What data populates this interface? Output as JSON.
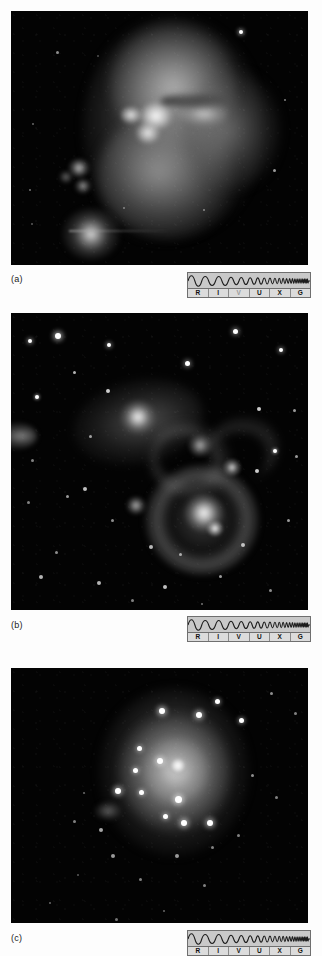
{
  "figure": {
    "background_color": "#fdfdfd",
    "image_background_color": "#000000",
    "panel_count": 3
  },
  "spectrum_band": {
    "name": "electromagnetic-spectrum-indicator",
    "description": "Wave increasing in frequency from left to right across the electromagnetic spectrum",
    "band_background": "#c9c9c9",
    "label_row_background": "#dcdcdc",
    "border_color": "#6f6f6f",
    "labels": [
      {
        "code": "R",
        "meaning": "Radio"
      },
      {
        "code": "I",
        "meaning": "Infrared"
      },
      {
        "code": "V",
        "meaning": "Visible"
      },
      {
        "code": "U",
        "meaning": "Ultraviolet"
      },
      {
        "code": "X",
        "meaning": "X-ray"
      },
      {
        "code": "G",
        "meaning": "Gamma ray"
      }
    ]
  },
  "panels": [
    {
      "id": "a",
      "caption": "(a)",
      "subject": "irregular-galaxy-with-bright-knots",
      "active_band": "V",
      "band_labels": [
        {
          "code": "R",
          "active": true
        },
        {
          "code": "I",
          "active": true
        },
        {
          "code": "V",
          "active": false
        },
        {
          "code": "U",
          "active": true
        },
        {
          "code": "X",
          "active": true
        },
        {
          "code": "G",
          "active": true
        }
      ]
    },
    {
      "id": "b",
      "caption": "(b)",
      "subject": "interacting-galaxy-pair-with-shell-and-starfield",
      "active_band": "V",
      "band_labels": [
        {
          "code": "R",
          "active": true
        },
        {
          "code": "I",
          "active": true
        },
        {
          "code": "V",
          "active": true
        },
        {
          "code": "U",
          "active": true
        },
        {
          "code": "X",
          "active": true
        },
        {
          "code": "G",
          "active": true
        }
      ]
    },
    {
      "id": "c",
      "caption": "(c)",
      "subject": "dwarf-irregular-galaxy-with-bright-core",
      "active_band": "V",
      "band_labels": [
        {
          "code": "R",
          "active": true
        },
        {
          "code": "I",
          "active": true
        },
        {
          "code": "V",
          "active": true
        },
        {
          "code": "U",
          "active": true
        },
        {
          "code": "X",
          "active": true
        },
        {
          "code": "G",
          "active": true
        }
      ]
    }
  ]
}
